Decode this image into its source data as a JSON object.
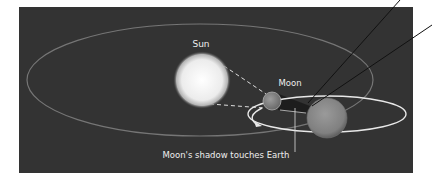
{
  "diagram": {
    "type": "solar-eclipse-geometry",
    "labels": {
      "sun": "Sun",
      "moon": "Moon",
      "caption": "Moon's shadow touches Earth"
    },
    "colors": {
      "background": "#333333",
      "page": "#ffffff",
      "orbit_earth": "#7a7a7a",
      "orbit_moon": "#e6e6e6",
      "sun": "#f2f2f2",
      "moon": "#8a8a8a",
      "earth": "#8f8f8f",
      "text": "#eeeeee",
      "pointer_lines": "#111111"
    },
    "elements": [
      {
        "name": "Sun",
        "cx": 202,
        "cy": 80,
        "r": 27
      },
      {
        "name": "Moon",
        "cx": 272,
        "cy": 101,
        "r": 9
      },
      {
        "name": "Earth",
        "cx": 327,
        "cy": 118,
        "r": 20
      }
    ]
  }
}
